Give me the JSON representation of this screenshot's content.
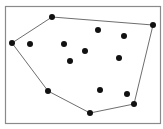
{
  "diagram": {
    "type": "convex-hull",
    "frame": {
      "x": 5,
      "y": 6,
      "width": 155,
      "height": 117,
      "stroke": "#8a8a8a"
    },
    "hull_stroke": "#6e6e6e",
    "point_color": "#111111",
    "point_radius": 3,
    "hull_points": [
      {
        "x": 12,
        "y": 43
      },
      {
        "x": 52,
        "y": 17
      },
      {
        "x": 153,
        "y": 25
      },
      {
        "x": 134,
        "y": 104
      },
      {
        "x": 90,
        "y": 113
      },
      {
        "x": 48,
        "y": 91
      }
    ],
    "interior_points": [
      {
        "x": 30,
        "y": 44
      },
      {
        "x": 64,
        "y": 44
      },
      {
        "x": 70,
        "y": 61
      },
      {
        "x": 85,
        "y": 51
      },
      {
        "x": 98,
        "y": 30
      },
      {
        "x": 124,
        "y": 36
      },
      {
        "x": 119,
        "y": 58
      },
      {
        "x": 100,
        "y": 90
      },
      {
        "x": 127,
        "y": 94
      }
    ]
  }
}
